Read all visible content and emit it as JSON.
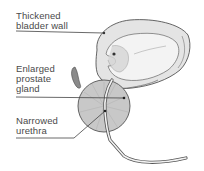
{
  "diagram": {
    "labels": [
      {
        "id": "bladder",
        "lines": [
          "Thickened",
          "bladder wall"
        ]
      },
      {
        "id": "prostate",
        "lines": [
          "Enlarged",
          "prostate",
          "gland"
        ]
      },
      {
        "id": "urethra",
        "lines": [
          "Narrowed",
          "urethra"
        ]
      }
    ],
    "colors": {
      "outline": "#555555",
      "bladder_fill": "#e4e4e4",
      "bladder_inner": "#f2f2f2",
      "prostate_fill": "#c8c8c8",
      "leader_line": "#444444",
      "text": "#4a4a4a"
    }
  }
}
